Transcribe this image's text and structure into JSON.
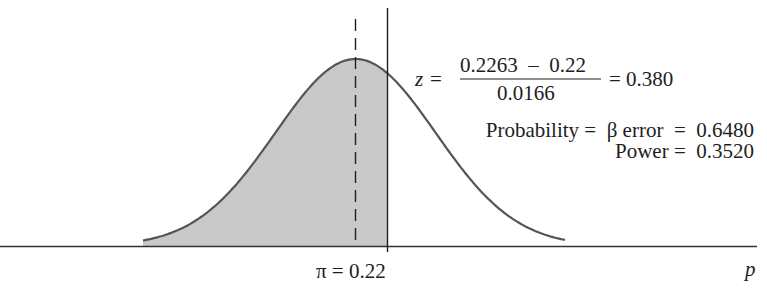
{
  "figure": {
    "x_axis_label": "p",
    "hypothesized_mean_label": "π = 0.22",
    "equation": {
      "lhs": "z =",
      "numerator": "0.2263  –  0.22",
      "denominator": "0.0166",
      "result": "= 0.380"
    },
    "probability_line": "Probability =  β error  =  0.6480",
    "power_line": "Power =  0.3520",
    "colors": {
      "shaded_region": "#c9c9c9",
      "curve": "#555555",
      "lines": "#1e1e1e"
    }
  },
  "chart_data": {
    "type": "area",
    "title": "",
    "xlabel": "p",
    "ylabel": "",
    "distribution": "normal",
    "mean_line_label": "π = 0.22",
    "hypothesized_value": 0.22,
    "critical_value": 0.2263,
    "standard_error": 0.0166,
    "z": 0.38,
    "beta_error": 0.648,
    "power": 0.352,
    "shaded_region": "left of critical value (beta error)",
    "dashed_line": "distribution center",
    "solid_line": "critical value"
  }
}
